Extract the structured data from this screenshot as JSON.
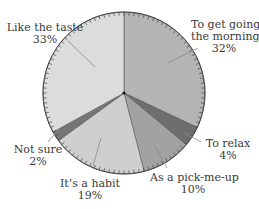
{
  "chart_data": {
    "type": "pie",
    "title": "",
    "start_angle_deg": 0,
    "direction": "clockwise",
    "categories": [
      "To get going in the morning",
      "To relax",
      "As a pick-me-up",
      "It's a habit",
      "Not sure",
      "Like the taste"
    ],
    "values": [
      32,
      4,
      10,
      19,
      2,
      33
    ],
    "unit": "%",
    "colors": [
      "#b4b4b4",
      "#6e6e6e",
      "#a2a2a2",
      "#cfcfcf",
      "#767676",
      "#dcdcdc"
    ],
    "legend": "none (direct labels with leader lines)",
    "rim_ticks": true
  },
  "labels": {
    "get_going": {
      "line1": "To get going in",
      "line2": "the morning",
      "pct": "32%"
    },
    "relax": {
      "line1": "To relax",
      "pct": "4%"
    },
    "pickme": {
      "line1": "As a pick-me-up",
      "pct": "10%"
    },
    "habit": {
      "line1": "It’s a habit",
      "pct": "19%"
    },
    "notsure": {
      "line1": "Not sure",
      "pct": "2%"
    },
    "taste": {
      "line1": "Like the taste",
      "pct": "33%"
    }
  }
}
